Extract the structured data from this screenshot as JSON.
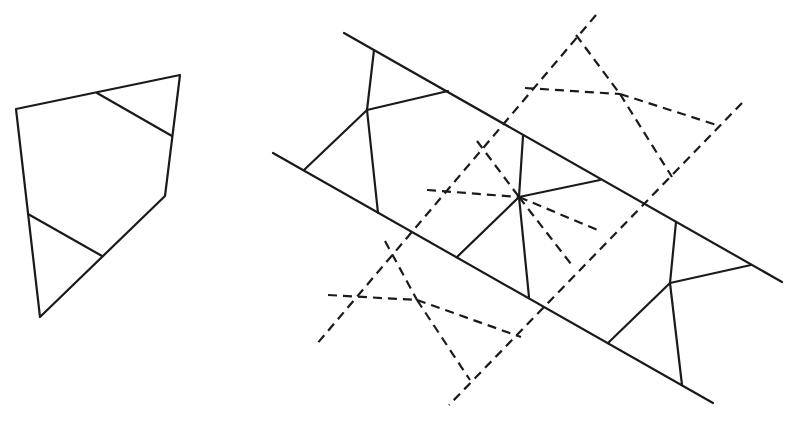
{
  "figure": {
    "width": 795,
    "height": 429,
    "stroke_color": "#1a1a1a",
    "background": "#ffffff",
    "left_shape": {
      "outline": [
        [
          16,
          109
        ],
        [
          180,
          75
        ],
        [
          165,
          196
        ],
        [
          40,
          317
        ]
      ],
      "inner_lines": [
        [
          [
            97,
            93
          ],
          [
            172,
            136
          ]
        ],
        [
          [
            28,
            214
          ],
          [
            102,
            256
          ]
        ]
      ]
    },
    "strip_solid": {
      "top_line": [
        [
          344,
          33
        ],
        [
          782,
          282
        ]
      ],
      "bottom_line": [
        [
          273,
          153
        ],
        [
          713,
          403
        ]
      ],
      "pieces": [
        {
          "center": [
            367,
            110
          ],
          "spokes": [
            [
              374,
              50
            ],
            [
              448,
              91
            ],
            [
              304,
              170
            ],
            [
              378,
              213
            ]
          ]
        },
        {
          "center": [
            519,
            197
          ],
          "spokes": [
            [
              523,
              136
            ],
            [
              600,
              180
            ],
            [
              457,
              257
            ],
            [
              529,
              297
            ]
          ]
        },
        {
          "center": [
            670,
            283
          ],
          "spokes": [
            [
              676,
              222
            ],
            [
              751,
              265
            ],
            [
              608,
              343
            ],
            [
              682,
              385
            ]
          ]
        }
      ]
    },
    "strip_dashed": {
      "left_line": [
        [
          596,
          15
        ],
        [
          316,
          345
        ]
      ],
      "right_line": [
        [
          742,
          103
        ],
        [
          449,
          405
        ]
      ],
      "segments": [
        [
          [
            576,
            35
          ],
          [
            620,
            94
          ]
        ],
        [
          [
            620,
            94
          ],
          [
            672,
            177
          ]
        ],
        [
          [
            525,
            88
          ],
          [
            620,
            94
          ]
        ],
        [
          [
            620,
            94
          ],
          [
            720,
            126
          ]
        ],
        [
          [
            477,
            141
          ],
          [
            519,
            197
          ]
        ],
        [
          [
            427,
            190
          ],
          [
            519,
            197
          ]
        ],
        [
          [
            519,
            197
          ],
          [
            600,
            231
          ]
        ],
        [
          [
            519,
            197
          ],
          [
            571,
            264
          ]
        ],
        [
          [
            385,
            241
          ],
          [
            417,
            300
          ]
        ],
        [
          [
            417,
            300
          ],
          [
            470,
            380
          ]
        ],
        [
          [
            328,
            295
          ],
          [
            417,
            300
          ]
        ],
        [
          [
            417,
            300
          ],
          [
            521,
            337
          ]
        ]
      ]
    }
  }
}
